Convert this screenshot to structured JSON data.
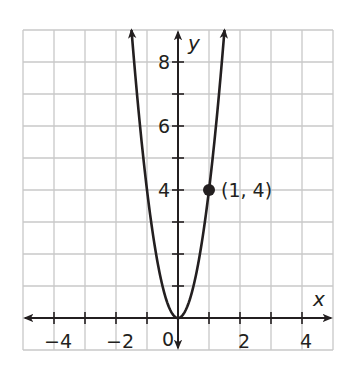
{
  "chart_data": {
    "type": "line",
    "title": "",
    "xlabel": "x",
    "ylabel": "y",
    "xlim": [
      -5,
      5
    ],
    "ylim": [
      -1,
      9
    ],
    "grid": true,
    "x_tick_labels": [
      {
        "value": -4,
        "label": "−4"
      },
      {
        "value": -2,
        "label": "−2"
      },
      {
        "value": 2,
        "label": "2"
      },
      {
        "value": 4,
        "label": "4"
      }
    ],
    "y_tick_labels": [
      {
        "value": 4,
        "label": "4"
      },
      {
        "value": 6,
        "label": "6"
      },
      {
        "value": 8,
        "label": "8"
      }
    ],
    "origin_label": "0",
    "series": [
      {
        "name": "y = 4x^2",
        "equation": "y = 4x²",
        "x": [
          -1.5,
          -1.25,
          -1,
          -0.75,
          -0.5,
          -0.25,
          0,
          0.25,
          0.5,
          0.75,
          1,
          1.25,
          1.5
        ],
        "values": [
          9,
          6.25,
          4,
          2.25,
          1,
          0.25,
          0,
          0.25,
          1,
          2.25,
          4,
          6.25,
          9
        ],
        "color": "#231f20",
        "arrows_at_ends": true
      }
    ],
    "annotations": [
      {
        "type": "point",
        "x": 1,
        "y": 4,
        "label": "(1, 4)"
      }
    ]
  },
  "colors": {
    "grid": "#c8c8c8",
    "axis": "#231f20",
    "curve": "#231f20",
    "background": "#ffffff"
  }
}
